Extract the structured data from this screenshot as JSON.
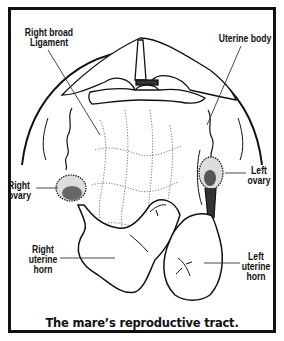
{
  "figure": {
    "caption": "The mare’s reproductive tract.",
    "labels": {
      "right_broad_ligament": "Right broad\nLigament",
      "uterine_body": "Uterine body",
      "right_ovary": "Right\novary",
      "left_ovary": "Left\novary",
      "right_uterine_horn": "Right\nuterine\nhorn",
      "left_uterine_horn": "Left\nuterine\nhorn"
    },
    "colors": {
      "ink": "#111111",
      "background": "#ffffff"
    }
  }
}
